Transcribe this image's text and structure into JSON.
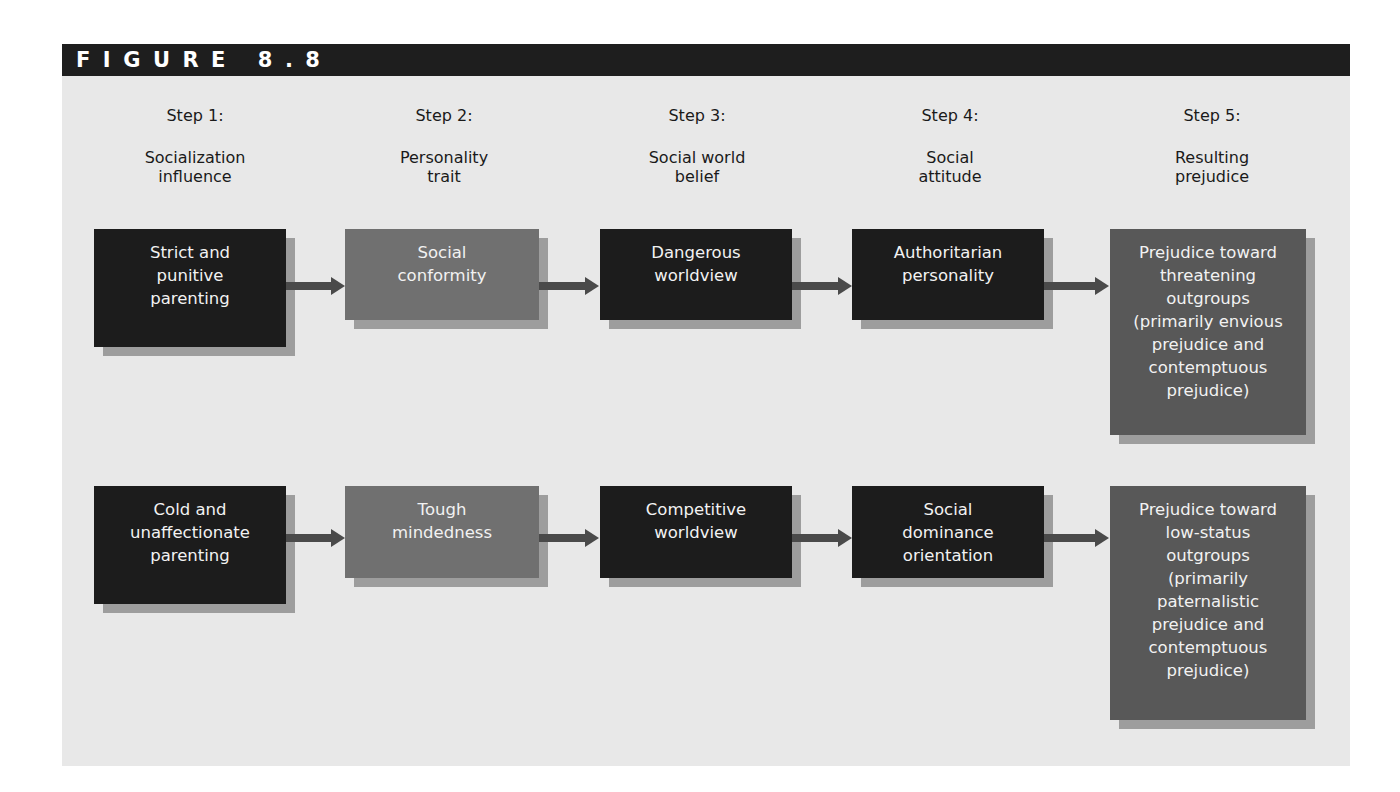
{
  "figure": {
    "label": "FIGURE 8.8"
  },
  "steps": [
    {
      "number": "Step 1:",
      "title": "Socialization\ninfluence"
    },
    {
      "number": "Step 2:",
      "title": "Personality\ntrait"
    },
    {
      "number": "Step 3:",
      "title": "Social world\nbelief"
    },
    {
      "number": "Step 4:",
      "title": "Social\nattitude"
    },
    {
      "number": "Step 5:",
      "title": "Resulting\nprejudice"
    }
  ],
  "paths": [
    {
      "name": "authoritarian-path",
      "nodes": [
        "Strict and\npunitive\nparenting",
        "Social\nconformity",
        "Dangerous\nworldview",
        "Authoritarian\npersonality",
        "Prejudice toward\nthreatening\noutgroups\n(primarily envious\nprejudice and\ncontemptuous\nprejudice)"
      ]
    },
    {
      "name": "social-dominance-path",
      "nodes": [
        "Cold and\nunaffectionate\nparenting",
        "Tough\nmindedness",
        "Competitive\nworldview",
        "Social\ndominance\norientation",
        "Prejudice toward\nlow-status\noutgroups\n(primarily\npaternalistic\nprejudice and\ncontemptuous\nprejudice)"
      ]
    }
  ],
  "colors": {
    "panel_bg": "#e8e8e8",
    "header_bg": "#1e1e1e",
    "dark_box": "#1c1c1c",
    "mid_box": "#707070",
    "result_box": "#585858",
    "shadow": "#9d9d9d",
    "arrow": "#4a4a4a"
  }
}
